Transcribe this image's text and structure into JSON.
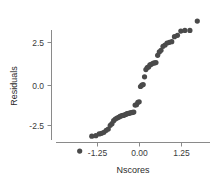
{
  "chart_data": {
    "type": "scatter",
    "title": "",
    "xlabel": "Nscores",
    "ylabel": "Residuals",
    "xlim": [
      -1.95,
      1.95
    ],
    "ylim": [
      -4.6,
      4.4
    ],
    "xticks": [
      -1.25,
      0.0,
      1.25
    ],
    "xticklabels": [
      "-1.25",
      "0.00",
      "1.25"
    ],
    "yticks": [
      -2.5,
      0.0,
      2.5
    ],
    "yticklabels": [
      "-2.5",
      "0.0",
      "2.5"
    ],
    "grid": false,
    "legend": false,
    "marker": {
      "shape": "circle",
      "color": "#4a4a4a",
      "size": 2.6
    },
    "series": [
      {
        "name": "residuals",
        "x": [
          -1.78,
          -1.42,
          -1.3,
          -1.2,
          -1.13,
          -1.06,
          -0.99,
          -0.93,
          -0.87,
          -0.82,
          -0.77,
          -0.72,
          -0.67,
          -0.62,
          -0.58,
          -0.53,
          -0.49,
          -0.45,
          -0.41,
          -0.37,
          -0.33,
          -0.29,
          -0.25,
          -0.21,
          -0.17,
          -0.13,
          -0.09,
          -0.05,
          -0.01,
          0.03,
          0.07,
          0.11,
          0.15,
          0.19,
          0.23,
          0.27,
          0.31,
          0.35,
          0.4,
          0.44,
          0.49,
          0.54,
          0.59,
          0.64,
          0.7,
          0.76,
          0.82,
          0.89,
          0.96,
          1.04,
          1.13,
          1.23,
          1.35,
          1.5,
          1.72
        ],
        "y": [
          -3.95,
          -3.05,
          -3.02,
          -2.92,
          -2.88,
          -2.82,
          -2.7,
          -2.62,
          -2.4,
          -2.3,
          -2.12,
          -2.02,
          -1.96,
          -1.92,
          -1.86,
          -1.82,
          -1.8,
          -1.78,
          -1.74,
          -1.7,
          -1.68,
          -1.66,
          -1.64,
          -1.62,
          -1.6,
          -1.18,
          -1.16,
          -1.02,
          -0.98,
          -0.06,
          0.02,
          0.06,
          0.52,
          0.96,
          1.08,
          1.12,
          1.24,
          1.28,
          1.34,
          1.36,
          1.38,
          1.82,
          2.02,
          2.12,
          2.36,
          2.44,
          2.56,
          2.6,
          2.64,
          2.94,
          3.02,
          3.28,
          3.32,
          3.32,
          3.88
        ]
      }
    ]
  },
  "axes": {
    "x_title": "Nscores",
    "y_title": "Residuals",
    "x_tick_0": "-1.25",
    "x_tick_1": "0.00",
    "x_tick_2": "1.25",
    "y_tick_0": "2.5",
    "y_tick_1": "0.0",
    "y_tick_2": "-2.5"
  },
  "colors": {
    "point": "#4a4a4a",
    "axis": "#8a8a8a",
    "text": "#2b2b2b",
    "background": "#ffffff"
  }
}
